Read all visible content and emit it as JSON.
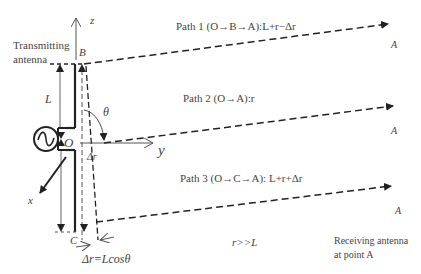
{
  "diagram": {
    "labels": {
      "z_axis": "z",
      "y_axis": "y",
      "x_axis": "x",
      "transmitting_line1": "Transmitting",
      "transmitting_line2": "antenna",
      "point_B": "B",
      "point_O": "O",
      "point_C": "C",
      "length_L": "L",
      "theta": "θ",
      "delta_r": "Δr",
      "delta_r_formula": "Δr=Lcosθ",
      "r_much_greater": "r>>L",
      "receiving_line1": "Receiving antenna",
      "receiving_line2": "at point A"
    },
    "paths": [
      {
        "label": "Path 1 (O→B→A):L+r−Δr",
        "endpoint": "A"
      },
      {
        "label": "Path 2 (O→A):r",
        "endpoint": "A"
      },
      {
        "label": "Path 3 (O→C→A): L+r+Δr",
        "endpoint": "A"
      }
    ],
    "colors": {
      "line": "#222222",
      "text": "#444444",
      "thin": "#555555"
    }
  }
}
